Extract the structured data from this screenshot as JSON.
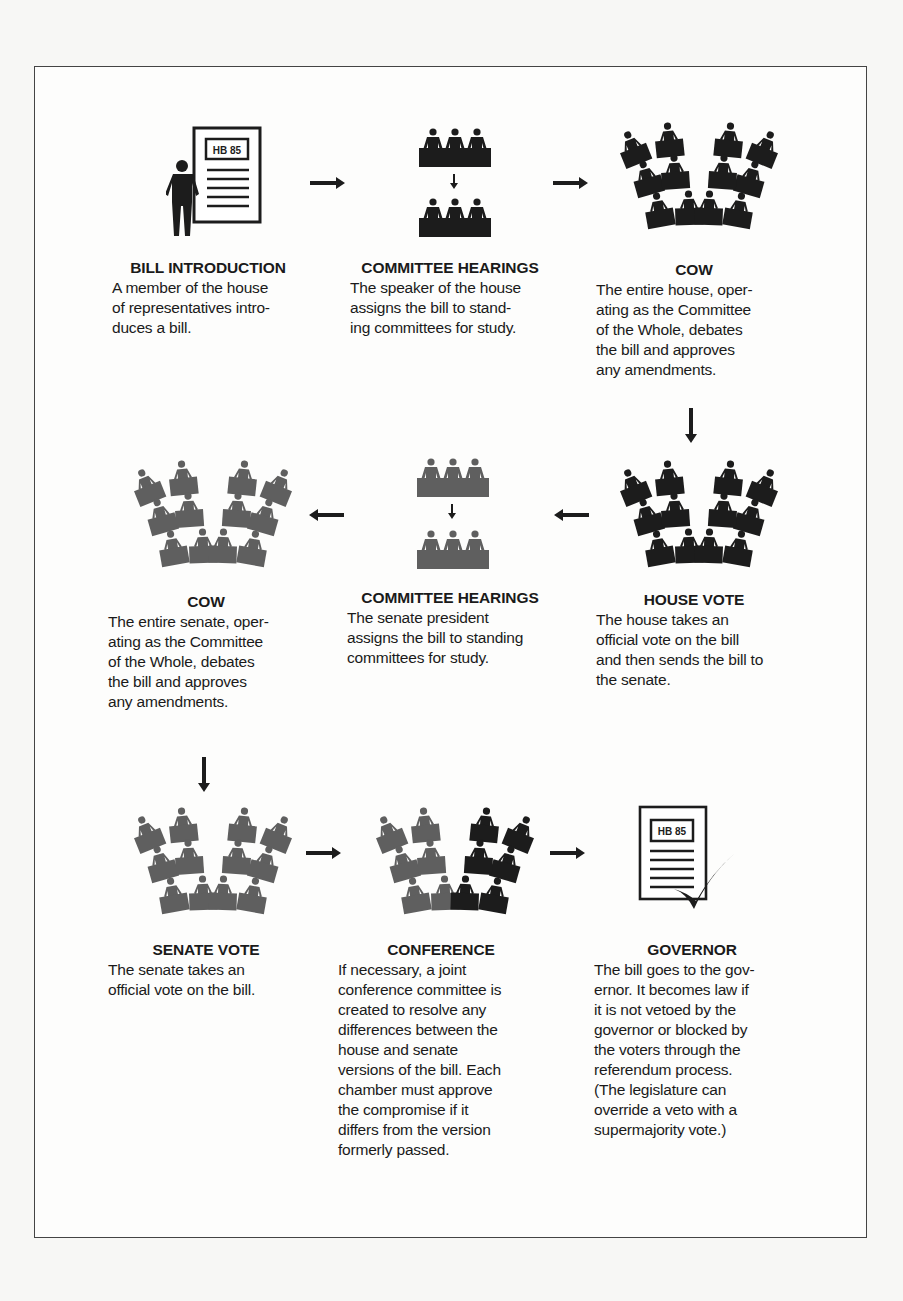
{
  "diagram": {
    "colors": {
      "house": "#1c1c1c",
      "senate": "#5f5f5f",
      "text": "#1a1a1a",
      "border": "#444444"
    },
    "document_label": "HB 85",
    "steps": [
      {
        "id": "bill-introduction",
        "chamber": "house",
        "title": "BILL INTRODUCTION",
        "description": "A member of the house\nof representatives intro-\nduces a bill."
      },
      {
        "id": "committee-hearings-house",
        "chamber": "house",
        "title": "COMMITTEE HEARINGS",
        "description": "The speaker of the house\nassigns the bill to stand-\ning committees for study."
      },
      {
        "id": "cow-house",
        "chamber": "house",
        "title": "COW",
        "description": "The entire house, oper-\nating as the Committee\nof the Whole, debates\nthe bill and approves\nany amendments."
      },
      {
        "id": "house-vote",
        "chamber": "house",
        "title": "HOUSE VOTE",
        "description": "The  house takes an\nofficial vote on the bill\nand then sends the bill to\nthe senate."
      },
      {
        "id": "committee-hearings-senate",
        "chamber": "senate",
        "title": "COMMITTEE HEARINGS",
        "description": " The senate president\nassigns the bill to standing\ncommittees for study."
      },
      {
        "id": "cow-senate",
        "chamber": "senate",
        "title": "COW",
        "description": "The entire senate, oper-\nating as the Committee\nof the Whole, debates\nthe bill and approves\nany amendments."
      },
      {
        "id": "senate-vote",
        "chamber": "senate",
        "title": "SENATE VOTE",
        "description": "The senate takes an\nofficial vote on the bill."
      },
      {
        "id": "conference",
        "chamber": "both",
        "title": "CONFERENCE",
        "description": "If necessary, a joint\nconference committee is\ncreated to resolve any\ndifferences between the\nhouse and senate\nversions of the bill.  Each\nchamber must approve\nthe compromise if it\ndiffers from the version\nformerly passed."
      },
      {
        "id": "governor",
        "chamber": "governor",
        "title": "GOVERNOR",
        "description": "The bill goes to the gov-\nernor. It  becomes law if\nit is not vetoed  by the\ngovernor or blocked by\nthe voters through the\nreferendum process.\n(The legislature can\noverride a veto with a\nsupermajority vote.)"
      }
    ],
    "flow": [
      {
        "from": "bill-introduction",
        "to": "committee-hearings-house",
        "direction": "right"
      },
      {
        "from": "committee-hearings-house",
        "to": "cow-house",
        "direction": "right"
      },
      {
        "from": "cow-house",
        "to": "house-vote",
        "direction": "down"
      },
      {
        "from": "house-vote",
        "to": "committee-hearings-senate",
        "direction": "left"
      },
      {
        "from": "committee-hearings-senate",
        "to": "cow-senate",
        "direction": "left"
      },
      {
        "from": "cow-senate",
        "to": "senate-vote",
        "direction": "down"
      },
      {
        "from": "senate-vote",
        "to": "conference",
        "direction": "right"
      },
      {
        "from": "conference",
        "to": "governor",
        "direction": "right"
      }
    ]
  }
}
